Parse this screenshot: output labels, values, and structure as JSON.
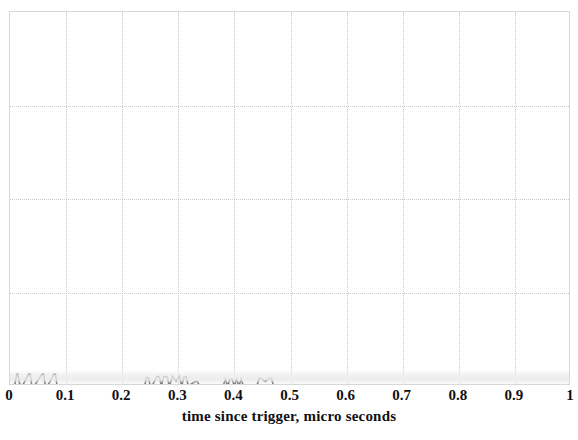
{
  "chart_data": {
    "type": "line",
    "title": "",
    "xlabel": "time since trigger, micro seconds",
    "ylabel": "",
    "xlim": [
      0,
      1
    ],
    "ylim": [
      0,
      1
    ],
    "grid": true,
    "legend": "none",
    "xticks": [
      0,
      0.1,
      0.2,
      0.3,
      0.4,
      0.5,
      0.6,
      0.7,
      0.8,
      0.9,
      1
    ],
    "xtick_labels": [
      "0",
      "0.1",
      "0.2",
      "0.3",
      "0.4",
      "0.5",
      "0.6",
      "0.7",
      "0.8",
      "0.9",
      "1"
    ],
    "yticks": [],
    "ytick_labels": [],
    "series": [
      {
        "name": "signal",
        "color": "#1a1a1a",
        "description": "oscilloscope trace, baseline near zero with narrow spikes and steps in the first 0.47 micro seconds",
        "x": [
          0.0,
          0.008,
          0.012,
          0.014,
          0.018,
          0.022,
          0.033,
          0.036,
          0.039,
          0.043,
          0.057,
          0.06,
          0.063,
          0.067,
          0.078,
          0.081,
          0.084,
          0.088,
          0.095,
          0.24,
          0.243,
          0.247,
          0.25,
          0.253,
          0.262,
          0.266,
          0.27,
          0.274,
          0.28,
          0.284,
          0.29,
          0.296,
          0.302,
          0.306,
          0.31,
          0.314,
          0.318,
          0.33,
          0.334,
          0.338,
          0.38,
          0.384,
          0.388,
          0.392,
          0.396,
          0.4,
          0.404,
          0.408,
          0.412,
          0.416,
          0.44,
          0.444,
          0.448,
          0.455,
          0.462,
          0.466,
          0.47,
          0.6,
          0.8,
          1.0
        ],
        "y": [
          0.0,
          0.0,
          0.031,
          0.031,
          0.0,
          0.0,
          0.031,
          0.031,
          0.0,
          0.0,
          0.031,
          0.031,
          0.0,
          0.0,
          0.031,
          0.031,
          0.0,
          0.0,
          0.0,
          0.0,
          0.022,
          0.022,
          0.0,
          0.0,
          0.025,
          0.025,
          0.0,
          0.025,
          0.025,
          0.0,
          0.026,
          0.013,
          0.026,
          0.0,
          0.024,
          0.024,
          0.0,
          0.012,
          0.012,
          0.0,
          0.0,
          0.018,
          0.0,
          0.018,
          0.018,
          0.0,
          0.018,
          0.0,
          0.018,
          0.0,
          0.0,
          0.02,
          0.02,
          0.012,
          0.02,
          0.02,
          0.0,
          0.0,
          0.0,
          0.0
        ]
      }
    ],
    "gridlines_vertical_at": [
      0.1,
      0.2,
      0.3,
      0.4,
      0.5,
      0.6,
      0.7,
      0.8,
      0.9
    ],
    "gridlines_horizontal_at": [
      0.25,
      0.5,
      0.75
    ]
  },
  "axis": {
    "x_title": "time since trigger, micro seconds"
  },
  "colors": {
    "background": "#ffffff",
    "frame": "#d8d8d8",
    "grid": "#c9c9c9",
    "trace": "#1a1a1a",
    "text": "#101010"
  }
}
